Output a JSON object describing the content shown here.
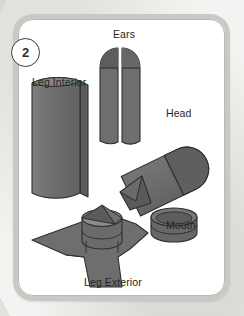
{
  "card": {
    "step_number": "2",
    "background_color": "#f4f3f1",
    "frame_color": "#c9c8c5",
    "card_color": "#ffffff"
  },
  "diagram": {
    "type": "exploded-parts-illustration",
    "title_parts": [
      "Ears",
      "Leg Interior",
      "Head",
      "Mouth",
      "Leg Exterior"
    ],
    "shape_fill": "#6e6e6e",
    "shape_fill_dark": "#565656",
    "shape_fill_light": "#8d8d8d",
    "shape_stroke": "#2f2f2f",
    "parts": [
      {
        "id": "ears",
        "label": "Ears",
        "description": "two arch-topped panels with horizontal seam",
        "count": 2
      },
      {
        "id": "leg-interior",
        "label": "Leg Interior",
        "description": "curved folded rectangular panel",
        "count": 1
      },
      {
        "id": "head",
        "label": "Head",
        "description": "tilted capsule cylinder with rounded cap and folded tip",
        "count": 1
      },
      {
        "id": "mouth",
        "label": "Mouth",
        "description": "short disc cylinder with elliptical rim",
        "count": 1
      },
      {
        "id": "leg-exterior",
        "label": "Leg Exterior",
        "description": "three-armed star panel with central cylinder",
        "count": 1
      }
    ]
  }
}
